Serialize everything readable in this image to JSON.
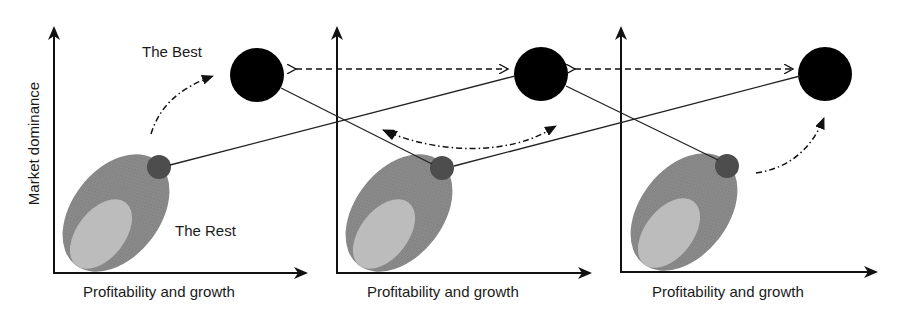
{
  "diagram": {
    "y_axis_label": "Market dominance",
    "labels": {
      "best": "The Best",
      "rest": "The Rest"
    },
    "panels": [
      {
        "id": 1,
        "x_axis_label": "Profitability and growth"
      },
      {
        "id": 2,
        "x_axis_label": "Profitability and growth"
      },
      {
        "id": 3,
        "x_axis_label": "Profitability and growth"
      }
    ],
    "colors": {
      "axis": "#111111",
      "best_circle": "#000000",
      "small_circle": "#4a4a4a",
      "ellipse_outer": "#8a8a8a",
      "ellipse_inner": "#b9b9b9",
      "connector": "#222222"
    }
  }
}
